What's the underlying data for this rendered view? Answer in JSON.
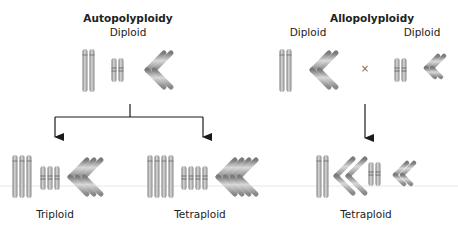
{
  "autopolyploidy": {
    "title": "Autopolyploidy",
    "parent_label": "Diploid",
    "children": [
      {
        "label": "Triploid",
        "copies": 3
      },
      {
        "label": "Tetraploid",
        "copies": 4
      }
    ]
  },
  "allopolyploidy": {
    "title": "Allopolyploidy",
    "parents": [
      {
        "label": "Diploid"
      },
      {
        "label": "Diploid"
      }
    ],
    "cross_symbol": "×",
    "child_label": "Tetraploid"
  },
  "colors": {
    "chromosome": "#a8a8a8",
    "chromosome_highlight": "#d4d4d4",
    "chromosome_shadow": "#7a7a7a",
    "arrow": "#1a1a1a",
    "baseline": "#e6e6e6"
  }
}
